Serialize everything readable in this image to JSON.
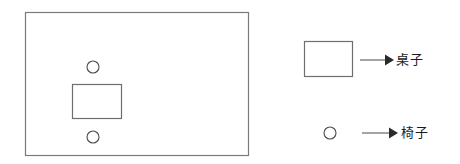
{
  "diagram": {
    "title": "",
    "background_color": "#ffffff",
    "stroke_color": "#7a7a7a",
    "text_color": "#1a1a1a",
    "stroke_width": 1.2,
    "room": {
      "label": "room-outline",
      "x": 25,
      "y": 12,
      "width": 223,
      "height": 143
    },
    "objects": [
      {
        "name": "chair-top",
        "shape": "circle",
        "cx": 93,
        "cy": 67,
        "r": 6
      },
      {
        "name": "table",
        "shape": "rect",
        "x": 72,
        "y": 84,
        "width": 49,
        "height": 34
      },
      {
        "name": "chair-bottom",
        "shape": "circle",
        "cx": 93,
        "cy": 137,
        "r": 6
      }
    ]
  },
  "legend": {
    "items": [
      {
        "key": "table",
        "symbol": "rect",
        "label": "桌子",
        "swatch": {
          "x": 304,
          "y": 41,
          "width": 48,
          "height": 35
        },
        "arrow": {
          "x1": 360,
          "y1": 60,
          "x2": 392,
          "y2": 60
        }
      },
      {
        "key": "chair",
        "symbol": "circle",
        "label": "椅子",
        "swatch": {
          "cx": 330,
          "cy": 133,
          "r": 6
        },
        "arrow": {
          "x1": 362,
          "y1": 133,
          "x2": 396,
          "y2": 133
        }
      }
    ]
  }
}
